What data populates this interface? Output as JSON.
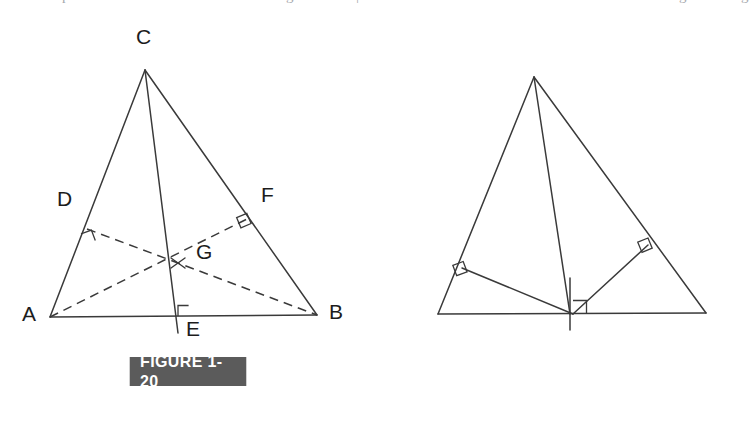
{
  "page": {
    "background_color": "#ffffff",
    "line_color": "#3a3a3a",
    "label_color": "#1c1c1c",
    "banner_color": "#5b5b5b",
    "banner_text_color": "#ffffff"
  },
  "top_bleed": {
    "fragments": [
      "p",
      "g",
      "|",
      "g",
      "g"
    ]
  },
  "figures": [
    {
      "id": "figure-1-20",
      "caption": "FIGURE 1-20",
      "description": "Triangle ABC with altitudes CE, AF and BD; the altitudes AF and BD are drawn dashed and meet CE at point G",
      "points": {
        "A": {
          "x": 50,
          "y": 317,
          "label": "A",
          "label_x": 22,
          "label_y": 305
        },
        "B": {
          "x": 317,
          "y": 315,
          "label": "B",
          "label_x": 330,
          "label_y": 303
        },
        "C": {
          "x": 145,
          "y": 70,
          "label": "C",
          "label_x": 135,
          "label_y": 28
        },
        "D": {
          "x": 87,
          "y": 229,
          "label": "D",
          "label_x": 56,
          "label_y": 190
        },
        "E": {
          "x": 178,
          "y": 316,
          "label": "E",
          "label_x": 186,
          "label_y": 320
        },
        "F": {
          "x": 247,
          "y": 219,
          "label": "F",
          "label_x": 261,
          "label_y": 185
        },
        "G": {
          "x": 178,
          "y": 263,
          "label": "G",
          "label_x": 196,
          "label_y": 240
        }
      },
      "segments": [
        {
          "name": "side-AB",
          "from": "A",
          "to": "B",
          "style": "solid"
        },
        {
          "name": "side-AC",
          "from": "A",
          "to": "C",
          "style": "solid"
        },
        {
          "name": "side-CB",
          "from": "C",
          "to": "B",
          "style": "solid"
        },
        {
          "name": "altitude-CE",
          "from": "C",
          "to": "E",
          "style": "solid"
        },
        {
          "name": "altitude-DB",
          "from": "D",
          "to": "B",
          "style": "dashed"
        },
        {
          "name": "altitude-AF",
          "from": "A",
          "to": "F",
          "style": "dashed"
        }
      ],
      "right_angles": [
        "at-D-on-AC",
        "at-F-on-CB",
        "at-E-on-AB"
      ],
      "intersection_mark": "x-cross-at-G"
    },
    {
      "id": "figure-1-21",
      "caption": "FIGURE 1-21",
      "description": "Triangle ABC with altitude CE and solid segments GD and GF drawn from G on AB to the feet D and F",
      "points": {
        "A": {
          "x": 438,
          "y": 314,
          "label": "A",
          "label_x": 411,
          "label_y": 303
        },
        "B": {
          "x": 706,
          "y": 313,
          "label": "B",
          "label_x": 719,
          "label_y": 300
        },
        "C": {
          "x": 534,
          "y": 77,
          "label": "C",
          "label_x": 524,
          "label_y": 34
        },
        "D": {
          "x": 462,
          "y": 268,
          "label": "D",
          "label_x": 432,
          "label_y": 232
        },
        "E": {
          "x": 568,
          "y": 314,
          "label": "E",
          "label_x": 548,
          "label_y": 320
        },
        "F": {
          "x": 648,
          "y": 245,
          "label": "F",
          "label_x": 663,
          "label_y": 211
        },
        "G": {
          "x": 573,
          "y": 314,
          "label": "G",
          "label_x": 581,
          "label_y": 320
        }
      },
      "segments": [
        {
          "name": "side-AB",
          "from": "A",
          "to": "B",
          "style": "solid"
        },
        {
          "name": "side-AC",
          "from": "A",
          "to": "C",
          "style": "solid"
        },
        {
          "name": "side-CB",
          "from": "C",
          "to": "B",
          "style": "solid"
        },
        {
          "name": "altitude-CE",
          "from": "C",
          "to": "E",
          "style": "solid"
        },
        {
          "name": "segment-GD",
          "from": "G",
          "to": "D",
          "style": "solid"
        },
        {
          "name": "segment-GF",
          "from": "G",
          "to": "F",
          "style": "solid"
        }
      ],
      "right_angles": [
        "at-D-on-AC",
        "at-F-on-CB",
        "at-G-on-AB"
      ],
      "tick_mark": "vertical-tick-above-G"
    }
  ]
}
